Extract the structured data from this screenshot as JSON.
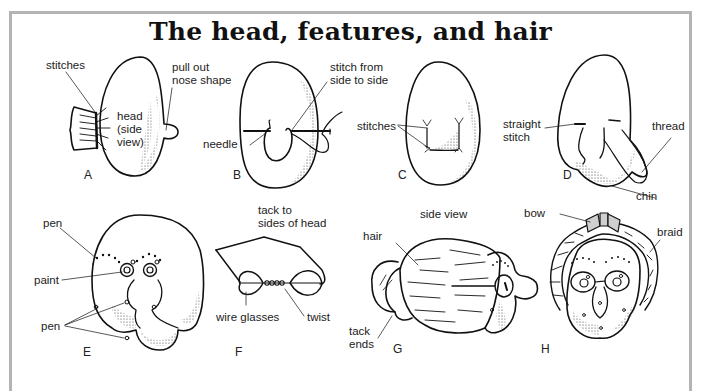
{
  "title": "The head, features, and hair",
  "panels": {
    "A": {
      "letter": "A",
      "labels": {
        "stitches": "stitches",
        "head": "head\n(side\nview)",
        "nose": "pull out\nnose shape"
      }
    },
    "B": {
      "letter": "B",
      "labels": {
        "needle": "needle",
        "stitch": "stitch from\nside to side"
      }
    },
    "C": {
      "letter": "C",
      "labels": {
        "stitches": "stitches"
      }
    },
    "D": {
      "letter": "D",
      "labels": {
        "straight": "straight\nstitch",
        "thread": "thread",
        "chin": "chin"
      }
    },
    "E": {
      "letter": "E",
      "labels": {
        "pen_top": "pen",
        "paint": "paint",
        "pen_bottom": "pen"
      }
    },
    "F": {
      "letter": "F",
      "labels": {
        "tack": "tack to\nsides of head",
        "glasses": "wire glasses",
        "twist": "twist"
      }
    },
    "G": {
      "letter": "G",
      "labels": {
        "side_view": "side view",
        "hair": "hair",
        "tack_ends": "tack\nends"
      }
    },
    "H": {
      "letter": "H",
      "labels": {
        "bow": "bow",
        "braid": "braid"
      }
    }
  },
  "colors": {
    "frame": "#b4b4b4",
    "ink": "#111111",
    "bow_fill": "#cfcfcf"
  }
}
